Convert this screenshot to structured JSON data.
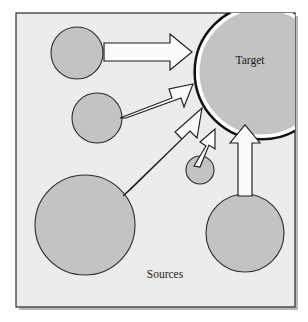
{
  "figure": {
    "type": "diagram",
    "kind": "sources-to-target-flow",
    "labels": {
      "target": "Target",
      "sources": "Sources"
    },
    "colors": {
      "panel_background": "#ececec",
      "panel_border": "#3a3a3a",
      "circle_fill": "#c3c3c3",
      "circle_stroke": "#2b2b2b",
      "arrow_fill": "#fbfbfb",
      "arrow_stroke": "#1d1d1d",
      "target_ring": "#121212",
      "page_background": "#ffffff",
      "label_text": "#1a1a1a"
    },
    "panel": {
      "x": 16,
      "y": 13,
      "width": 279,
      "height": 294
    },
    "label_positions": {
      "target": {
        "x": 250,
        "y": 61
      },
      "sources": {
        "x": 165,
        "y": 275
      }
    },
    "target_node": {
      "name": "target-circle",
      "cx": 262,
      "cy": 72,
      "r": 63,
      "ring_r": 67,
      "has_emphasis_ring": true,
      "clipped_by_panel": true
    },
    "source_nodes": [
      {
        "name": "source-circle-top-left",
        "cx": 77,
        "cy": 53,
        "r": 26
      },
      {
        "name": "source-circle-mid-left",
        "cx": 97,
        "cy": 118,
        "r": 25
      },
      {
        "name": "source-circle-large-bottom-left",
        "cx": 85,
        "cy": 225,
        "r": 50
      },
      {
        "name": "source-circle-small-center",
        "cx": 200,
        "cy": 170,
        "r": 14
      },
      {
        "name": "source-circle-bottom-right",
        "cx": 245,
        "cy": 233,
        "r": 39
      }
    ],
    "arrows": [
      {
        "name": "arrow-top-left-to-target",
        "from": "source-circle-top-left",
        "to": "target-circle",
        "points": "104,43 170,43 170,34 192,52 170,70 170,61 104,61",
        "direction": "right"
      },
      {
        "name": "arrow-mid-left-to-target",
        "from": "source-circle-mid-left",
        "to": "target-circle",
        "points": "120,118 172,98 169,89 193,84 184,107 181,98 126,118",
        "direction": "up-right"
      },
      {
        "name": "arrow-large-to-target",
        "from": "source-circle-large-bottom-left",
        "to": "target-circle",
        "points": "123,196 182,139 175,132 202,108 197,138 190,131 132,188",
        "direction": "up-right"
      },
      {
        "name": "arrow-small-center-to-target",
        "from": "source-circle-small-center",
        "to": "target-circle",
        "points": "194,166 206,146 200,142 215,129 215,149 209,145 200,167",
        "direction": "up-right"
      },
      {
        "name": "arrow-bottom-right-to-target",
        "from": "source-circle-bottom-right",
        "to": "target-circle",
        "points": "238,196 238,143 230,143 245,125 260,143 252,143 252,196",
        "direction": "up"
      }
    ]
  }
}
